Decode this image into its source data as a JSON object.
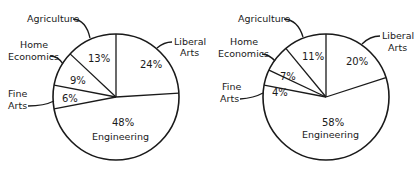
{
  "chart_data": [
    {
      "type": "pie",
      "title": "",
      "categories": [
        "Liberal Arts",
        "Engineering",
        "Fine Arts",
        "Home Economics",
        "Agriculture"
      ],
      "values": [
        24,
        48,
        6,
        9,
        13
      ],
      "labels": {
        "liberal_arts": "Liberal Arts",
        "engineering": "Engineering",
        "fine_arts": "Fine Arts",
        "home_economics": "Home Economics",
        "agriculture": "Agriculture"
      },
      "pct": {
        "liberal_arts": "24%",
        "engineering": "48%",
        "fine_arts": "6%",
        "home_economics": "9%",
        "agriculture": "13%"
      }
    },
    {
      "type": "pie",
      "title": "",
      "categories": [
        "Liberal Arts",
        "Engineering",
        "Fine Arts",
        "Home Economics",
        "Agriculture"
      ],
      "values": [
        20,
        58,
        4,
        7,
        11
      ],
      "labels": {
        "liberal_arts": "Liberal Arts",
        "engineering": "Engineering",
        "fine_arts": "Fine Arts",
        "home_economics": "Home Economics",
        "agriculture": "Agriculture"
      },
      "pct": {
        "liberal_arts": "20%",
        "engineering": "58%",
        "fine_arts": "4%",
        "home_economics": "7%",
        "agriculture": "11%"
      }
    }
  ],
  "text": {
    "agriculture": "Agriculture",
    "liberal1": "Liberal",
    "liberal2": "Arts",
    "home1": "Home",
    "home2": "Economics",
    "fine1": "Fine",
    "fine2": "Arts",
    "engineering": "Engineering"
  }
}
